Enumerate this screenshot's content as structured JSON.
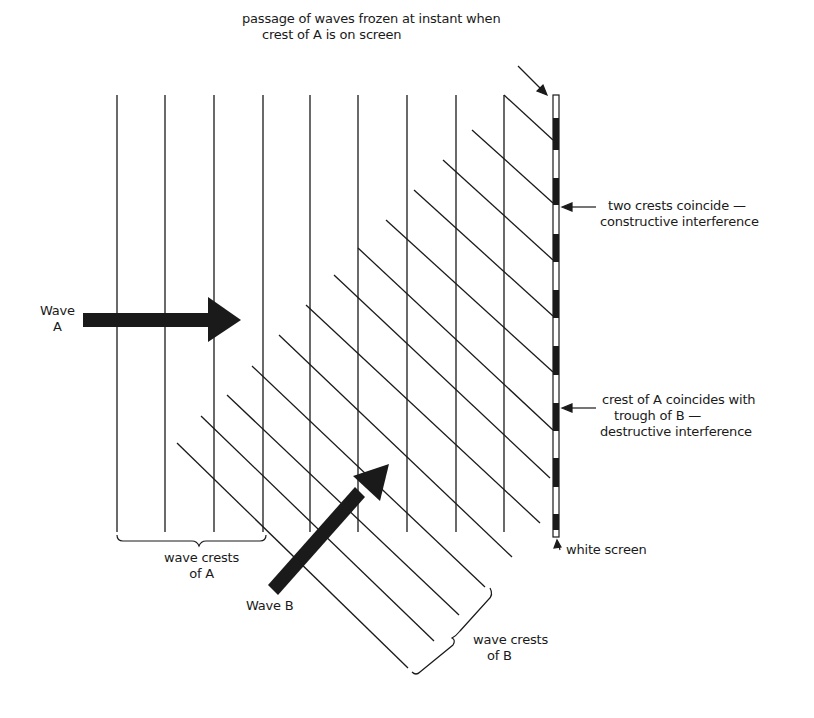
{
  "diagram": {
    "type": "wave-interference-illustration",
    "colors": {
      "ink": "#1a1a1a",
      "background": "#ffffff",
      "screen_dark": "#1a1a1a",
      "screen_light": "#ffffff"
    },
    "labels": {
      "passage": {
        "line1": "passage of waves frozen at instant when",
        "line2": "crest of A is on screen"
      },
      "constructive": {
        "line1": "two crests coincide —",
        "line2": "constructive interference"
      },
      "destructive": {
        "line1": "crest of A coincides with",
        "line2": "trough of B —",
        "line3": "destructive interference"
      },
      "white_screen": "white screen",
      "wave_a": {
        "line1": "Wave",
        "line2": "A"
      },
      "wave_b": "Wave B",
      "crests_a": {
        "line1": "wave crests",
        "line2": "of A"
      },
      "crests_b": {
        "line1": "wave crests",
        "line2": "of B"
      }
    },
    "wave_a_crests_x": [
      117,
      165,
      214,
      263,
      310,
      358,
      407,
      456,
      504
    ],
    "wave_a_crest_top_y": 95,
    "wave_a_crest_bottom_y": 532,
    "wave_b_crest_count": 13,
    "screen": {
      "x": 553,
      "top": 95,
      "bottom": 537,
      "width": 6
    },
    "screen_dark_bands": [
      [
        118,
        150
      ],
      [
        178,
        205
      ],
      [
        234,
        262
      ],
      [
        290,
        318
      ],
      [
        346,
        375
      ],
      [
        403,
        431
      ],
      [
        458,
        487
      ],
      [
        514,
        530
      ]
    ]
  }
}
